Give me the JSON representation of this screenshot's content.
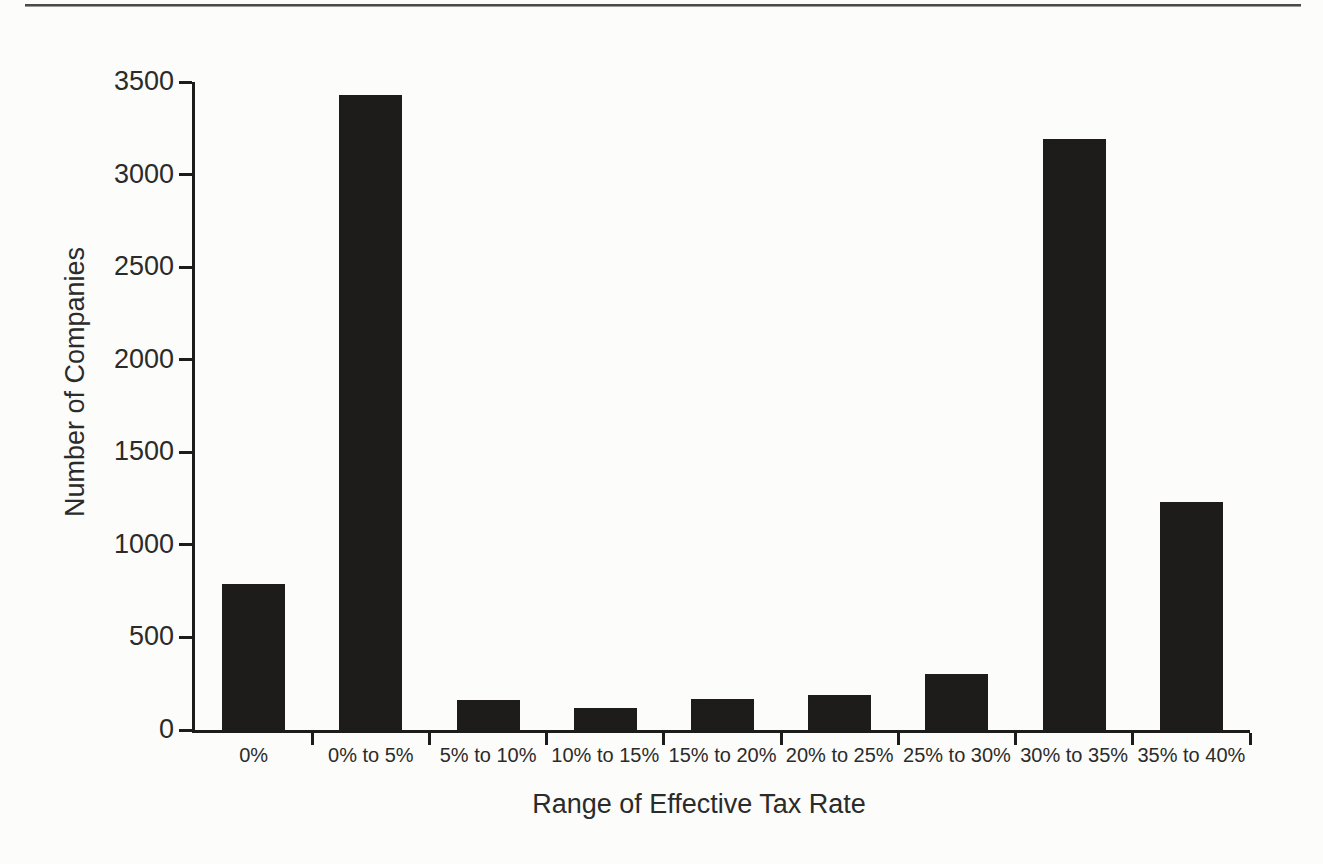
{
  "chart_data": {
    "type": "bar",
    "title": "",
    "xlabel": "Range of Effective Tax Rate",
    "ylabel": "Number of Companies",
    "categories": [
      "0%",
      "0% to 5%",
      "5% to 10%",
      "10% to 15%",
      "15% to 20%",
      "20% to 25%",
      "25% to 30%",
      "30% to 35%",
      "35% to 40%"
    ],
    "values": [
      790,
      3430,
      160,
      120,
      170,
      190,
      300,
      3190,
      1230
    ],
    "ylim": [
      0,
      3500
    ],
    "ytick_step": 500,
    "ytick_labels": [
      "0",
      "500",
      "1000",
      "1500",
      "2000",
      "2500",
      "3000",
      "3500"
    ],
    "grid": false,
    "legend": "none",
    "bar_color": "#1d1c1a",
    "axis_color": "#1c1c1c",
    "text_color": "#2b2b29",
    "background_color": "#fcfcfb"
  }
}
